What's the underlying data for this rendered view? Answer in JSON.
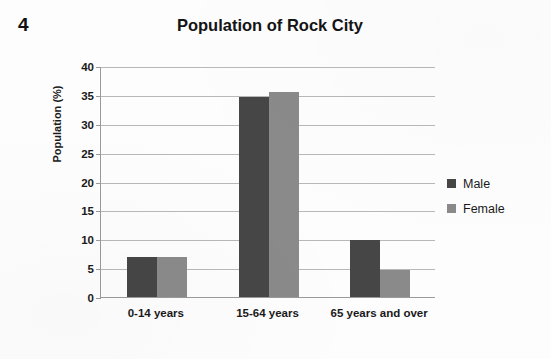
{
  "question_number": "4",
  "chart_data": {
    "type": "bar",
    "title": "Population of Rock City",
    "xlabel": "",
    "ylabel": "Population (%)",
    "categories": [
      "0-14 years",
      "15-64 years",
      "65 years and over"
    ],
    "series": [
      {
        "name": "Male",
        "color": "#464646",
        "values": [
          7.0,
          34.7,
          9.9
        ]
      },
      {
        "name": "Female",
        "color": "#8a8a8a",
        "values": [
          6.9,
          35.5,
          4.7
        ]
      }
    ],
    "ylim": [
      0,
      40
    ],
    "ytick_labels": [
      "40",
      "35",
      "30",
      "25",
      "20",
      "15",
      "10",
      "5",
      "0"
    ],
    "ytick_values": [
      40,
      35,
      30,
      25,
      20,
      15,
      10,
      5,
      0
    ],
    "grid": true,
    "legend_position": "right"
  }
}
